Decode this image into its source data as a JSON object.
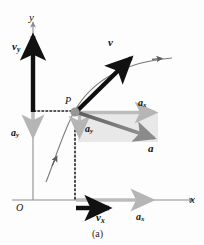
{
  "figure": {
    "caption": "(a)",
    "background_color": "#fdfdfd",
    "axes": {
      "x_label": "x",
      "y_label": "y",
      "origin_label": "O",
      "axis_color": "#8a8a8a"
    },
    "point": {
      "label": "P",
      "marker_color": "#8f8f8f",
      "x": 74,
      "y": 110
    },
    "vectors": [
      {
        "name": "velocity",
        "label": "v",
        "color": "#111111",
        "style": "bold-black",
        "from": [
          74,
          110
        ],
        "to": [
          134,
          55
        ],
        "label_pos": [
          110,
          38
        ]
      },
      {
        "name": "velocity-y-component",
        "label": "v",
        "subscript": "y",
        "color": "#111111",
        "style": "bold-black",
        "from": [
          33,
          118
        ],
        "to": [
          33,
          40
        ],
        "label_pos": [
          14,
          42
        ]
      },
      {
        "name": "velocity-x-component",
        "label": "v",
        "subscript": "x",
        "color": "#111111",
        "style": "bold-black",
        "from": [
          75,
          208
        ],
        "to": [
          113,
          208
        ],
        "label_pos": [
          98,
          217
        ]
      },
      {
        "name": "acceleration",
        "label": "a",
        "color": "#808080",
        "style": "gray",
        "from": [
          74,
          112
        ],
        "to": [
          158,
          140
        ],
        "label_pos": [
          151,
          150
        ]
      },
      {
        "name": "acceleration-x-component-at-P",
        "label": "a",
        "subscript": "x",
        "color": "#b8b8b8",
        "style": "gray",
        "from": [
          78,
          112
        ],
        "to": [
          158,
          112
        ],
        "label_pos": [
          140,
          101
        ]
      },
      {
        "name": "acceleration-y-component-at-P",
        "label": "a",
        "subscript": "y",
        "color": "#b8b8b8",
        "style": "gray",
        "from": [
          79,
          114
        ],
        "to": [
          79,
          140
        ],
        "label_pos": [
          83,
          130
        ]
      },
      {
        "name": "acceleration-y-component-on-axis",
        "label": "a",
        "subscript": "y",
        "color": "#b8b8b8",
        "style": "gray",
        "from": [
          33,
          112
        ],
        "to": [
          33,
          140
        ],
        "label_pos": [
          12,
          133
        ]
      },
      {
        "name": "acceleration-x-component-on-axis",
        "label": "a",
        "subscript": "x",
        "color": "#b8b8b8",
        "style": "gray",
        "from": [
          75,
          200
        ],
        "to": [
          155,
          200
        ],
        "label_pos": [
          138,
          217
        ]
      }
    ],
    "trajectory": {
      "name": "projectile-path",
      "color": "#7a7a7a",
      "arrow_count": 2
    },
    "guides": {
      "color": "#1a1a1a",
      "horizontal_from_y_axis": true,
      "vertical_to_x_axis": true
    },
    "shaded_box": {
      "color": "#e6e6e6"
    }
  }
}
